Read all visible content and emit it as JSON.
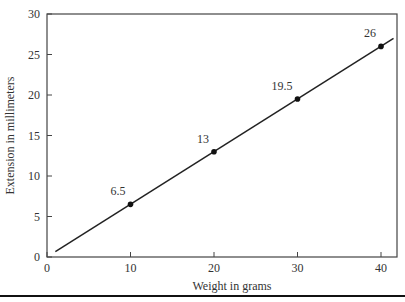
{
  "chart_data": {
    "type": "line",
    "title": "",
    "xlabel": "Weight in grams",
    "ylabel": "Extension in millimeters",
    "xlim": [
      0,
      42
    ],
    "ylim": [
      0,
      30
    ],
    "xticks": [
      0,
      10,
      20,
      30,
      40
    ],
    "yticks": [
      0,
      5,
      10,
      15,
      20,
      25,
      30
    ],
    "grid": false,
    "legend": null,
    "series": [
      {
        "name": "Extension",
        "x": [
          10,
          20,
          30,
          40
        ],
        "y": [
          6.5,
          13,
          19.5,
          26
        ],
        "point_labels": [
          "6.5",
          "13",
          "19.5",
          "26"
        ]
      }
    ],
    "fit_line": {
      "x": [
        1,
        41.5
      ],
      "y": [
        0.65,
        26.98
      ]
    }
  }
}
